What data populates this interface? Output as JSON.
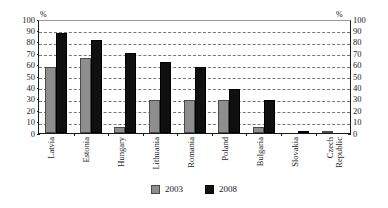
{
  "chart_data": {
    "type": "bar",
    "title": "",
    "subtitle": "",
    "xlabel": "",
    "ylabel": "%",
    "ylabel_right": "%",
    "ylim": [
      0,
      100
    ],
    "ytick_step": 10,
    "yticks": [
      100,
      90,
      80,
      70,
      60,
      50,
      40,
      30,
      20,
      10,
      0
    ],
    "grid": true,
    "grid_style": "dashed horizontal",
    "legend_position": "bottom-center",
    "dual_axis": true,
    "categories": [
      "Latvia",
      "Estonia",
      "Hungary",
      "Lithuania",
      "Romania",
      "Poland",
      "Bulgaria",
      "Slovakia",
      "Czech Republic"
    ],
    "category_lines": [
      [
        "Latvia"
      ],
      [
        "Estonia"
      ],
      [
        "Hungary"
      ],
      [
        "Lithuania"
      ],
      [
        "Romania"
      ],
      [
        "Poland"
      ],
      [
        "Bulgaria"
      ],
      [
        "Slovakia"
      ],
      [
        "Czech",
        "Republic"
      ]
    ],
    "series": [
      {
        "name": "2003",
        "color": "#8e8e8e",
        "values": [
          58,
          66,
          5,
          29,
          29,
          29,
          5,
          0,
          0.5
        ]
      },
      {
        "name": "2008",
        "color": "#101010",
        "values": [
          88,
          82,
          70,
          62,
          58,
          39,
          29,
          2,
          0
        ]
      }
    ]
  },
  "legend": {
    "items": [
      {
        "label": "2003",
        "swatch": "y2003"
      },
      {
        "label": "2008",
        "swatch": "y2008"
      }
    ]
  }
}
